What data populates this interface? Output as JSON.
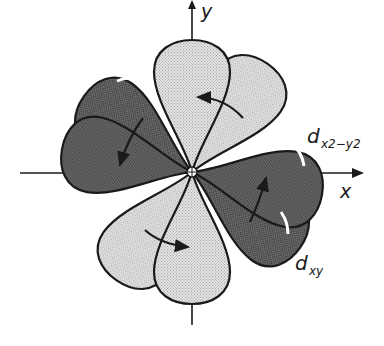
{
  "diagram": {
    "type": "orbital-diagram",
    "axes": {
      "x_label": "x",
      "y_label": "y"
    },
    "orbitals": [
      {
        "name": "d_x2-y2",
        "label_main": "d",
        "label_sub": "x2−y2",
        "shade": "light",
        "orientation": "45deg"
      },
      {
        "name": "d_xy",
        "label_main": "d",
        "label_sub": "xy",
        "shade": "dark",
        "orientation": "axes"
      }
    ],
    "colors": {
      "light_lobe": "#d9d9d9",
      "dark_lobe": "#6e6e6e",
      "outline": "#1a1a1a",
      "highlight": "#ffffff"
    },
    "rotation_arrows": 4
  }
}
